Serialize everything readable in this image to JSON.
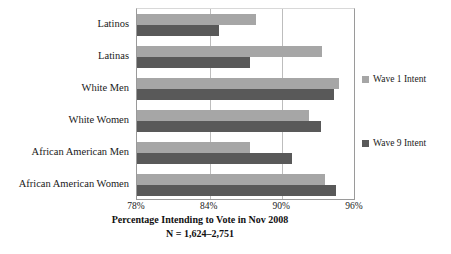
{
  "chart_data": {
    "type": "bar",
    "orientation": "horizontal",
    "title": "Percentage Intending to Vote in Nov 2008",
    "subtitle": "N = 1,624–2,751",
    "xlabel": "Percentage Intending to Vote in Nov 2008",
    "ylabel": "",
    "xlim": [
      78,
      96
    ],
    "xticks": [
      "78%",
      "84%",
      "90%",
      "96%"
    ],
    "xtick_values": [
      78,
      84,
      90,
      96
    ],
    "grid": "vertical",
    "legend_position": "right",
    "categories": [
      "Latinos",
      "Latinas",
      "White Men",
      "White Women",
      "African American Men",
      "African American Women"
    ],
    "series": [
      {
        "name": "Wave 1 Intent",
        "color": "#a6a6a6",
        "values": [
          87.8,
          93.3,
          94.7,
          92.2,
          87.3,
          93.5
        ]
      },
      {
        "name": "Wave 9 Intent",
        "color": "#595959",
        "values": [
          84.8,
          87.3,
          94.3,
          93.2,
          90.8,
          94.4
        ]
      }
    ]
  },
  "legend": {
    "items": [
      {
        "label": "Wave 1 Intent",
        "color": "#a6a6a6"
      },
      {
        "label": "Wave 9 Intent",
        "color": "#595959"
      }
    ]
  }
}
